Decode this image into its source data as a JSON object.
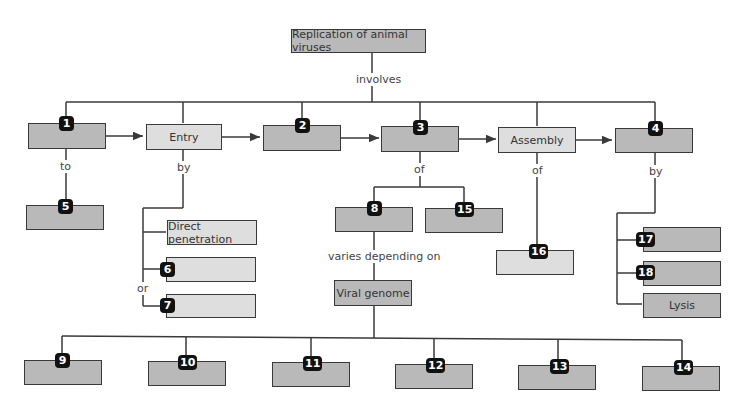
{
  "title": "Replication of animal viruses",
  "labels": {
    "involves": "involves",
    "to": "to",
    "by_entry": "by",
    "of_3": "of",
    "of_assembly": "of",
    "by_4": "by",
    "or": "or",
    "varies": "varies depending on"
  },
  "boxes": {
    "b1": {
      "badge": "1",
      "text": ""
    },
    "entry": {
      "text": "Entry"
    },
    "b2": {
      "badge": "2",
      "text": ""
    },
    "b3": {
      "badge": "3",
      "text": ""
    },
    "assembly": {
      "text": "Assembly"
    },
    "b4": {
      "badge": "4",
      "text": ""
    },
    "b5": {
      "badge": "5",
      "text": ""
    },
    "direct": {
      "text": "Direct penetration"
    },
    "b6": {
      "badge": "6",
      "text": ""
    },
    "b7": {
      "badge": "7",
      "text": ""
    },
    "b8": {
      "badge": "8",
      "text": ""
    },
    "b15": {
      "badge": "15",
      "text": ""
    },
    "viral": {
      "text": "Viral genome"
    },
    "b16": {
      "badge": "16",
      "text": ""
    },
    "b17": {
      "badge": "17",
      "text": ""
    },
    "b18": {
      "badge": "18",
      "text": ""
    },
    "lysis": {
      "text": "Lysis"
    },
    "b9": {
      "badge": "9",
      "text": ""
    },
    "b10": {
      "badge": "10",
      "text": ""
    },
    "b11": {
      "badge": "11",
      "text": ""
    },
    "b12": {
      "badge": "12",
      "text": ""
    },
    "b13": {
      "badge": "13",
      "text": ""
    },
    "b14": {
      "badge": "14",
      "text": ""
    }
  },
  "colors": {
    "dark_box": "#b9b9b9",
    "light_box": "#dedede",
    "badge": "#111111",
    "line": "#3a3a3a"
  }
}
